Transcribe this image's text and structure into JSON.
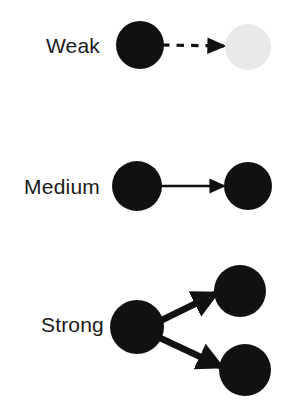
{
  "figure": {
    "kind": "legend-diagram",
    "background_color": "#ffffff",
    "node_color": "#111111",
    "faded_node_color": "#e9e9e9",
    "arrow_color": "#111111",
    "label_color": "#1a1a1a"
  },
  "rows": [
    {
      "id": "weak",
      "label": "Weak",
      "arrow_style": "dashed",
      "arrow_thickness": 2,
      "arrowhead_size": "small",
      "targets": 1,
      "source_node": {
        "cx": 140,
        "cy": 45,
        "r": 24,
        "fill": "#111111"
      },
      "target_nodes": [
        {
          "cx": 248,
          "cy": 47,
          "r": 23,
          "fill": "#e9e9e9"
        }
      ],
      "arrows": [
        {
          "x1": 162,
          "y1": 45,
          "x2": 224,
          "y2": 46
        }
      ]
    },
    {
      "id": "medium",
      "label": "Medium",
      "arrow_style": "solid",
      "arrow_thickness": 2.4,
      "arrowhead_size": "medium",
      "targets": 1,
      "source_node": {
        "cx": 137,
        "cy": 186,
        "r": 25,
        "fill": "#111111"
      },
      "target_nodes": [
        {
          "cx": 248,
          "cy": 186,
          "r": 24,
          "fill": "#111111"
        }
      ],
      "arrows": [
        {
          "x1": 159,
          "y1": 186,
          "x2": 224,
          "y2": 186
        }
      ]
    },
    {
      "id": "strong",
      "label": "Strong",
      "arrow_style": "solid",
      "arrow_thickness": 6.5,
      "arrowhead_size": "large",
      "targets": 2,
      "source_node": {
        "cx": 137,
        "cy": 327,
        "r": 27,
        "fill": "#111111"
      },
      "target_nodes": [
        {
          "cx": 240,
          "cy": 291,
          "r": 26,
          "fill": "#111111"
        },
        {
          "cx": 245,
          "cy": 370,
          "r": 26,
          "fill": "#111111"
        }
      ],
      "arrows": [
        {
          "x1": 158,
          "y1": 322,
          "x2": 217,
          "y2": 293
        },
        {
          "x1": 158,
          "y1": 337,
          "x2": 222,
          "y2": 367
        }
      ]
    }
  ],
  "labels": {
    "weak": {
      "text": "Weak",
      "x": 100,
      "y": 53,
      "anchor": "end"
    },
    "medium": {
      "text": "Medium",
      "x": 100,
      "y": 194,
      "anchor": "end"
    },
    "strong": {
      "text": "Strong",
      "x": 104,
      "y": 332,
      "anchor": "end"
    }
  }
}
